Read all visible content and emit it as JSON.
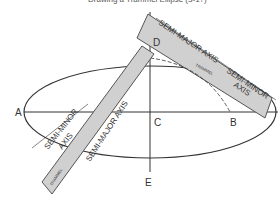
{
  "title": "Drawing a Trammel Ellipse (3-1?)",
  "points": {
    "A": "A",
    "B": "B",
    "C": "C",
    "D": "D",
    "E": "E"
  },
  "labels": {
    "semi_major_top": "SEMI-MAJOR AXIS",
    "semi_minor_top": "SEMI-MINOR",
    "semi_minor_top_2": "AXIS",
    "semi_minor_left": "SEMI-MINOR",
    "semi_minor_left_2": "AXIS",
    "semi_major_on_trammel": "SEMI-MAJOR AXIS",
    "trammel_top": "TRAMMEL",
    "trammel_bottom": "TRAMMEL"
  },
  "colors": {
    "line": "#333333",
    "trammel_fill": "#d0d0d0",
    "trammel_stroke": "#555555"
  }
}
